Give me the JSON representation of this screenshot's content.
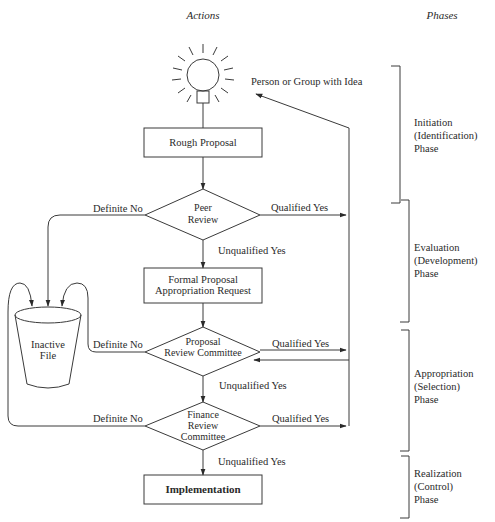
{
  "headers": {
    "actions": "Actions",
    "phases": "Phases"
  },
  "idea": {
    "label": "Person or Group with Idea",
    "icon": "lightbulb-icon"
  },
  "nodes": {
    "rough_proposal": "Rough Proposal",
    "peer_review": [
      "Peer",
      "Review"
    ],
    "formal_proposal": [
      "Formal Proposal",
      "Appropriation Request"
    ],
    "proposal_review": [
      "Proposal",
      "Review Committee"
    ],
    "finance_review": [
      "Finance",
      "Review",
      "Committee"
    ],
    "implementation": "Implementation",
    "inactive_file": [
      "Inactive",
      "File"
    ]
  },
  "edges": {
    "definite_no": "Definite No",
    "qualified_yes": "Qualified Yes",
    "unqualified_yes": "Unqualified Yes"
  },
  "phases": [
    {
      "name": "Initiation",
      "sub": "(Identification)",
      "suffix": "Phase"
    },
    {
      "name": "Evaluation",
      "sub": "(Development)",
      "suffix": "Phase"
    },
    {
      "name": "Appropriation",
      "sub": "(Selection)",
      "suffix": "Phase"
    },
    {
      "name": "Realization",
      "sub": "(Control)",
      "suffix": "Phase"
    }
  ],
  "colors": {
    "line": "#3a3a3a",
    "text": "#2a2a2a",
    "background": "#ffffff"
  }
}
